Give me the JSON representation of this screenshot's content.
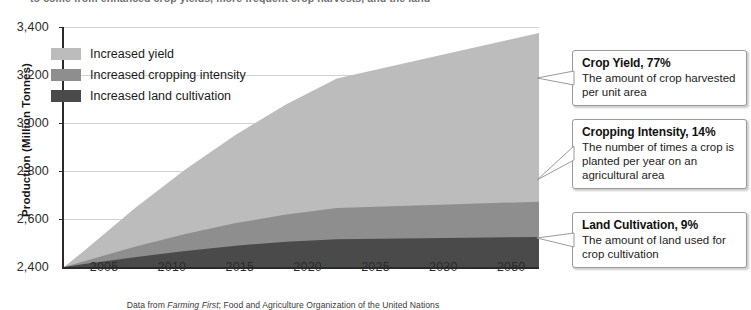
{
  "page": {
    "cutoff_text": "to come from enhanced crop yields, more frequent crop harvests, and the land"
  },
  "chart_data": {
    "type": "area",
    "title": "",
    "subtitle": "",
    "xlabel": "",
    "ylabel": "Production (Million Tonnes)",
    "stacked": true,
    "grid": true,
    "legend_position": "inside-top-left",
    "xlim": [
      2003,
      2050
    ],
    "ylim": [
      2400,
      3400
    ],
    "ytick_labels": [
      "3,400",
      "3,200",
      "3,000",
      "2,800",
      "2,600",
      "2,400"
    ],
    "ytick_values": [
      3400,
      3200,
      3000,
      2800,
      2600,
      2400
    ],
    "xtick_labels": [
      "2005",
      "2010",
      "2015",
      "2020",
      "2025",
      "2030",
      "2050"
    ],
    "xtick_values": [
      2005,
      2010,
      2015,
      2020,
      2025,
      2030,
      2050
    ],
    "x": [
      2003,
      2005,
      2010,
      2015,
      2020,
      2025,
      2030,
      2050
    ],
    "series": [
      {
        "name": "Increased land cultivation",
        "color": "#4a4a4a",
        "values": [
          2400,
          2412,
          2441,
          2467,
          2489,
          2505,
          2516,
          2525
        ]
      },
      {
        "name": "Increased cropping intensity",
        "color": "#8e8e8e",
        "values": [
          2400,
          2424,
          2484,
          2537,
          2583,
          2619,
          2646,
          2672
        ]
      },
      {
        "name": "Increased yield",
        "color": "#bcbcbc",
        "values": [
          2400,
          2468,
          2645,
          2806,
          2951,
          3078,
          3185,
          3375
        ]
      }
    ],
    "legend": [
      {
        "label": "Increased yield",
        "color": "#bcbcbc"
      },
      {
        "label": "Increased cropping intensity",
        "color": "#8e8e8e"
      },
      {
        "label": "Increased land cultivation",
        "color": "#4a4a4a"
      }
    ],
    "annotations": [
      {
        "title": "Crop Yield, 77%",
        "body": "The amount of crop harvested per unit area",
        "share_percent": 77,
        "target_series": "Increased yield"
      },
      {
        "title": "Cropping Intensity, 14%",
        "body": "The number of times a crop is planted per year on an agricultural area",
        "share_percent": 14,
        "target_series": "Increased cropping intensity"
      },
      {
        "title": "Land Cultivation, 9%",
        "body": "The amount of land used for crop cultivation",
        "share_percent": 9,
        "target_series": "Increased land cultivation"
      }
    ],
    "caption_prefix": "Data from ",
    "caption_italic": "Farming First",
    "caption_suffix": "; Food and Agriculture Organization of the United Nations"
  }
}
